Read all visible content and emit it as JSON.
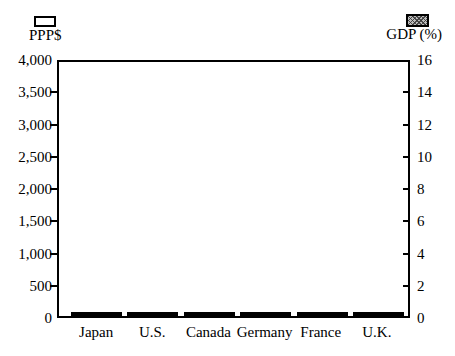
{
  "legend": {
    "ppp_label": "PPP$",
    "gdp_label": "GDP (%)"
  },
  "chart_data": {
    "type": "bar",
    "title": "",
    "categories": [
      "Japan",
      "U.S.",
      "Canada",
      "Germany",
      "France",
      "U.K."
    ],
    "series": [
      {
        "name": "PPP$",
        "axis": "left",
        "style": "white-outline",
        "values": [
          1460,
          3530,
          2030,
          1870,
          1900,
          1250
        ]
      },
      {
        "name": "GDP (%)",
        "axis": "right",
        "style": "gray-crosshatch",
        "values": [
          7.0,
          14.4,
          9.9,
          9.6,
          9.8,
          7.1
        ]
      }
    ],
    "left_axis": {
      "label": "PPP$",
      "min": 0,
      "max": 4000,
      "tick_values": [
        0,
        500,
        1000,
        1500,
        2000,
        2500,
        3000,
        3500,
        4000
      ],
      "tick_labels": [
        "0",
        "500",
        "1,000",
        "1,500",
        "2,000",
        "2,500",
        "3,000",
        "3,500",
        "4,000"
      ]
    },
    "right_axis": {
      "label": "GDP (%)",
      "min": 0,
      "max": 16,
      "tick_values": [
        0,
        2,
        4,
        6,
        8,
        10,
        12,
        14,
        16
      ],
      "tick_labels": [
        "0",
        "2",
        "4",
        "6",
        "8",
        "10",
        "12",
        "14",
        "16"
      ]
    },
    "legend_position": "top",
    "grid": false,
    "plot_border": "full-box"
  },
  "colors": {
    "line": "#000000",
    "background": "#ffffff",
    "bar_white_fill": "#ffffff",
    "bar_hatch_base": "#bdbdbd",
    "bar_hatch_lines": "#373737"
  }
}
